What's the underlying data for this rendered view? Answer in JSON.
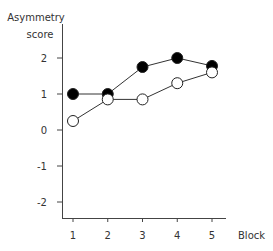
{
  "chart_data": {
    "type": "line",
    "title": "",
    "xlabel": "Block",
    "ylabel": "Asymmetry score",
    "ylabel_lines": [
      "Asymmetry",
      "score"
    ],
    "x": [
      1,
      2,
      3,
      4,
      5
    ],
    "x_ticks": [
      "1",
      "2",
      "3",
      "4",
      "5"
    ],
    "y_ticks": [
      "2",
      "1",
      "0",
      "-1",
      "-2"
    ],
    "ylim": [
      -2.5,
      2.6
    ],
    "grid": false,
    "legend": null,
    "series": [
      {
        "name": "filled circles",
        "marker": "filled",
        "values": [
          1.0,
          1.0,
          1.75,
          2.0,
          1.78
        ]
      },
      {
        "name": "open circles",
        "marker": "open",
        "values": [
          0.25,
          0.85,
          0.85,
          1.3,
          1.6
        ]
      }
    ]
  }
}
